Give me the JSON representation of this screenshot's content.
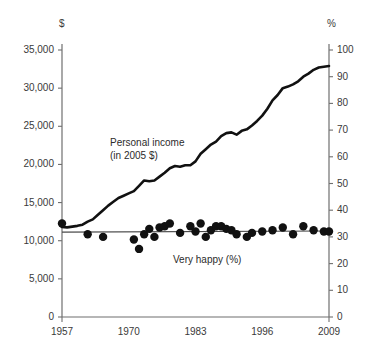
{
  "chart_data": {
    "type": "line",
    "title": "",
    "subtitle": "",
    "xlabel": "",
    "ylabel": "$",
    "y2label": "%",
    "grid": false,
    "legend_position": "inline-annotation",
    "xlim": [
      1957,
      2009
    ],
    "ylim": [
      0,
      37500
    ],
    "y2lim": [
      0,
      105
    ],
    "x_ticks": [
      1957,
      1970,
      1983,
      1996,
      2009
    ],
    "x_tick_labels": [
      "1957",
      "1970",
      "1983",
      "1996",
      "2009"
    ],
    "x_tick_marks_drawn": [
      1957,
      2009
    ],
    "y_ticks": [
      0,
      5000,
      10000,
      15000,
      20000,
      25000,
      30000,
      35000
    ],
    "y_tick_labels": [
      "0",
      "5,000",
      "10,000",
      "15,000",
      "20,000",
      "25,000",
      "30,000",
      "35,000"
    ],
    "y2_ticks": [
      0,
      10,
      20,
      30,
      40,
      50,
      60,
      70,
      80,
      90,
      100
    ],
    "y2_tick_labels": [
      "0",
      "10",
      "20",
      "30",
      "40",
      "50",
      "60",
      "70",
      "80",
      "90",
      "100"
    ],
    "series": [
      {
        "name": "Personal income (in 2005 $)",
        "annotation_line1": "Personal income",
        "annotation_line2": "(in 2005 $)",
        "type": "line",
        "axis": "left",
        "unit": "2005 dollars",
        "color": "#111111",
        "linewidth": 2.6,
        "x": [
          1957,
          1958,
          1959,
          1960,
          1961,
          1962,
          1963,
          1964,
          1965,
          1966,
          1967,
          1968,
          1969,
          1970,
          1971,
          1972,
          1973,
          1974,
          1975,
          1976,
          1977,
          1978,
          1979,
          1980,
          1981,
          1982,
          1983,
          1984,
          1985,
          1986,
          1987,
          1988,
          1989,
          1990,
          1991,
          1992,
          1993,
          1994,
          1995,
          1996,
          1997,
          1998,
          1999,
          2000,
          2001,
          2002,
          2003,
          2004,
          2005,
          2006,
          2007,
          2008,
          2009
        ],
        "values": [
          11800,
          11750,
          11850,
          11950,
          12100,
          12500,
          12800,
          13400,
          14000,
          14600,
          15100,
          15600,
          15900,
          16200,
          16500,
          17200,
          17900,
          17800,
          17900,
          18400,
          18900,
          19500,
          19800,
          19700,
          19900,
          19900,
          20400,
          21400,
          22000,
          22600,
          23000,
          23700,
          24100,
          24200,
          23900,
          24400,
          24600,
          25100,
          25700,
          26400,
          27300,
          28400,
          29100,
          30000,
          30200,
          30500,
          30900,
          31500,
          31900,
          32400,
          32700,
          32800,
          32900
        ]
      },
      {
        "name": "Very happy (%)",
        "annotation": "Very happy (%)",
        "type": "scatter",
        "axis": "right",
        "unit": "percent",
        "color": "#111111",
        "marker": "filled-circle",
        "marker_size": 4.2,
        "x": [
          1957,
          1962,
          1965,
          1971,
          1972,
          1973,
          1974,
          1975,
          1976,
          1977,
          1978,
          1980,
          1982,
          1983,
          1984,
          1985,
          1986,
          1987,
          1988,
          1989,
          1990,
          1991,
          1993,
          1994,
          1996,
          1998,
          2000,
          2002,
          2004,
          2006,
          2008,
          2009
        ],
        "values": [
          35,
          31,
          30,
          29,
          25.5,
          31,
          33,
          30,
          33.5,
          34,
          35,
          31.5,
          34,
          32,
          35,
          30,
          32.5,
          34,
          34,
          33,
          32.5,
          31,
          30,
          31.5,
          32,
          32.5,
          33.5,
          31,
          34,
          32.5,
          32,
          32
        ],
        "trend_line": {
          "present": true,
          "y_start": 31.8,
          "y_end": 32.2,
          "color": "#4a4a4a",
          "linewidth": 1.1
        }
      }
    ]
  },
  "axes": {
    "left_unit": "$",
    "right_unit": "%"
  }
}
